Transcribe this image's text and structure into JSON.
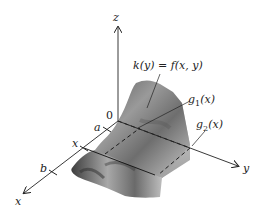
{
  "figure": {
    "axes": {
      "z_label": "z",
      "y_label": "y",
      "x_label": "x",
      "origin_label": "0"
    },
    "ticks": {
      "a": "a",
      "x": "x",
      "b": "b"
    },
    "annotations": {
      "cross_section": "k(y) = f(x, y)",
      "g1_name": "g",
      "g1_sub": "1",
      "g1_arg": "(x)",
      "g2_name": "g",
      "g2_sub": "2",
      "g2_arg": "(x)"
    },
    "colors": {
      "axis": "#222222",
      "surface_dark": "#4a4a4a",
      "surface_mid": "#8a8a8a",
      "surface_light": "#d0d0d0",
      "background": "#ffffff"
    }
  }
}
